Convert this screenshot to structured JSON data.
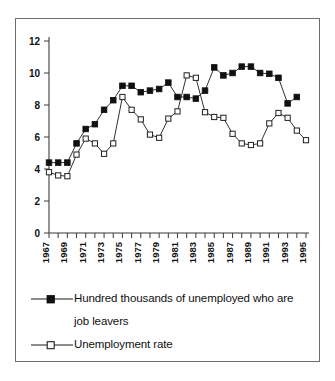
{
  "chart_data": {
    "type": "line",
    "title": "",
    "subtitle": "",
    "xlabel": "",
    "ylabel": "",
    "xlim": [
      1967,
      1995
    ],
    "ylim": [
      0,
      12
    ],
    "yticks": [
      0,
      2,
      4,
      6,
      8,
      10,
      12
    ],
    "grid": false,
    "legend_position": "bottom-left",
    "x": [
      1967,
      1968,
      1969,
      1970,
      1971,
      1972,
      1973,
      1974,
      1975,
      1976,
      1977,
      1978,
      1979,
      1980,
      1981,
      1982,
      1983,
      1984,
      1985,
      1986,
      1987,
      1988,
      1989,
      1990,
      1991,
      1992,
      1993,
      1994,
      1995
    ],
    "xtick_labels": [
      "1967",
      "",
      "1969",
      "",
      "1971",
      "",
      "1973",
      "",
      "1975",
      "",
      "1977",
      "",
      "1979",
      "",
      "1981",
      "",
      "1983",
      "",
      "1985",
      "",
      "1987",
      "",
      "1989",
      "",
      "1991",
      "",
      "1993",
      "",
      "1995"
    ],
    "xtick_labels_all": [
      "1967",
      "1968",
      "1969",
      "1970",
      "1971",
      "1972",
      "1973",
      "1974",
      "1975",
      "1976",
      "1977",
      "1978",
      "1979",
      "1980",
      "1981",
      "1982",
      "1983",
      "1984",
      "1985",
      "1986",
      "1987",
      "1988",
      "1989",
      "1990",
      "1991",
      "1992",
      "1993",
      "1994",
      "1995"
    ],
    "series": [
      {
        "name": "Hundred thousands of unemployed who are job leavers",
        "marker": "filled-square",
        "color": "#101010",
        "values": [
          4.4,
          4.4,
          4.4,
          5.6,
          6.5,
          6.8,
          7.7,
          8.3,
          9.2,
          9.2,
          8.8,
          8.9,
          9.0,
          9.4,
          8.5,
          8.5,
          8.4,
          8.9,
          10.35,
          9.85,
          10.0,
          10.4,
          10.4,
          10.0,
          9.95,
          9.7,
          8.1,
          8.5,
          null
        ]
      },
      {
        "name": "Unemployment rate",
        "marker": "hollow-square",
        "color": "#ffffff",
        "values": [
          3.8,
          3.6,
          3.55,
          4.9,
          5.9,
          5.6,
          4.95,
          5.6,
          8.5,
          7.7,
          7.1,
          6.15,
          5.95,
          7.15,
          7.6,
          9.85,
          9.7,
          7.55,
          7.25,
          7.2,
          6.2,
          5.6,
          5.5,
          5.6,
          6.85,
          7.5,
          7.2,
          6.4,
          5.8
        ]
      }
    ]
  },
  "legend": {
    "items": [
      {
        "line1": "Hundred thousands of unemployed who are",
        "line2": "job leavers",
        "marker": "filled-square-marker"
      },
      {
        "line1": "Unemployment rate",
        "line2": "",
        "marker": "hollow-square-marker"
      }
    ]
  }
}
